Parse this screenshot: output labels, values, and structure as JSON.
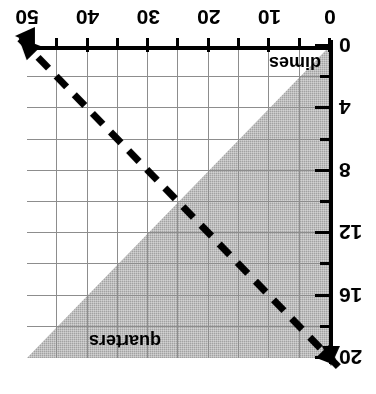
{
  "figure": {
    "orientation": "rotated-180",
    "colors": {
      "shade": "#a2a2a2",
      "grid": "#8d8d8d",
      "axis": "#000000",
      "boundary_line": "#000000",
      "background": "#ffffff"
    }
  },
  "chart_data": {
    "type": "line",
    "title": "",
    "subtitle": "",
    "xlabel": "dimes",
    "ylabel": "quarters",
    "xlim": [
      0,
      50
    ],
    "ylim": [
      0,
      20
    ],
    "grid": true,
    "legend": "none",
    "x_ticks_labeled": [
      0,
      10,
      20,
      30,
      40,
      50
    ],
    "x_ticks_minor": [
      5,
      15,
      25,
      35,
      45
    ],
    "y_ticks_labeled": [
      0,
      4,
      8,
      12,
      16,
      20
    ],
    "y_ticks_minor": [
      2,
      6,
      10,
      14,
      18
    ],
    "x_grid_values": [
      5,
      10,
      15,
      20,
      25,
      30,
      35,
      40,
      45
    ],
    "y_grid_values": [
      2,
      4,
      6,
      8,
      10,
      12,
      14,
      16,
      18
    ],
    "series": [
      {
        "name": "boundary",
        "style": "dashed",
        "arrowheads": "both",
        "x": [
          0,
          50
        ],
        "y": [
          20,
          0
        ],
        "points": [
          [
            0,
            20
          ],
          [
            50,
            0
          ]
        ]
      }
    ],
    "shaded_region": {
      "description": "region below the dashed boundary line",
      "vertices": [
        [
          0,
          0
        ],
        [
          50,
          0
        ],
        [
          0,
          20
        ]
      ],
      "fill": "#a2a2a2"
    },
    "annotations": [
      {
        "text": "dimes",
        "x": 10,
        "y": 1.4
      },
      {
        "text": "quarters",
        "x": 41,
        "y": 18.5
      }
    ]
  },
  "axes": {
    "x": {
      "name": "dimes",
      "tick_labels": [
        "0",
        "10",
        "20",
        "30",
        "40",
        "50"
      ]
    },
    "y": {
      "name": "quarters",
      "tick_labels": [
        "0",
        "4",
        "8",
        "12",
        "16",
        "20"
      ]
    }
  }
}
